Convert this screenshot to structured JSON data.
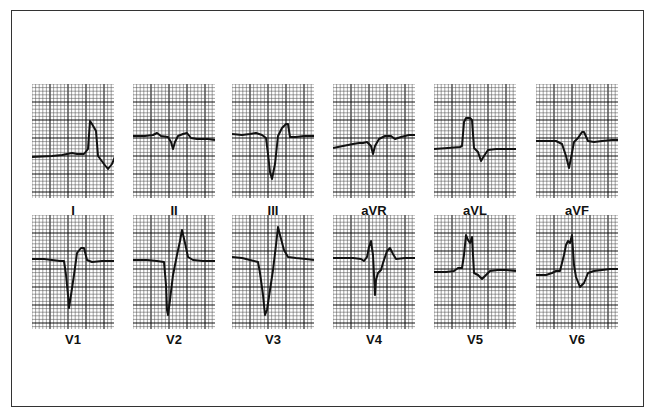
{
  "figure": {
    "title": "",
    "grid": {
      "small_cell_px": 3.6,
      "major_every": 5,
      "minor_color": "#555555",
      "major_color": "#111111",
      "trace_color": "#111111"
    },
    "leads": [
      {
        "label": "I",
        "row": 0,
        "col": 0,
        "points": "0,73 20,72 30,71 40,69 45,70 52,70 56,65 58,37 60,40 64,47 66,72 72,80 76,85 80,80 84,70 96,67 105,67 110,66 115,67"
      },
      {
        "label": "II",
        "row": 0,
        "col": 1,
        "points": "0,52 12,52 20,51 24,49 28,52 35,53 38,58 40,65 42,58 45,52 50,50 54,49 58,54 64,55 75,55 82,56"
      },
      {
        "label": "III",
        "row": 0,
        "col": 2,
        "points": "0,50 10,51 18,50 24,49 30,51 34,54 36,70 38,88 40,95 43,80 46,52 50,44 54,40 56,40 58,53 64,53 72,52 82,52"
      },
      {
        "label": "aVR",
        "row": 0,
        "col": 3,
        "points": "0,64 10,62 20,60 26,59 30,59 34,58 38,62 40,70 42,62 46,55 52,52 58,52 62,55 68,53 76,51 82,51"
      },
      {
        "label": "aVL",
        "row": 0,
        "col": 4,
        "points": "0,65 14,64 26,63 28,62 30,38 32,34 36,34 38,36 40,64 44,68 47,77 50,72 54,66 62,65 72,65 82,65"
      },
      {
        "label": "aVF",
        "row": 0,
        "col": 5,
        "points": "0,57 14,57 20,57 26,60 30,72 33,84 35,74 38,58 42,54 46,48 48,48 52,57 58,58 66,57 76,56 82,56"
      },
      {
        "label": "V1",
        "row": 1,
        "col": 0,
        "points": "0,44 12,44 20,45 28,46 32,46 34,60 36,80 37,93 39,80 42,60 45,38 49,33 52,33 55,45 60,47 70,46 82,46"
      },
      {
        "label": "V2",
        "row": 1,
        "col": 1,
        "points": "0,45 14,45 24,46 31,47 33,70 34,95 35,100 37,85 40,60 44,40 47,26 49,15 52,28 55,42 60,45 70,46 82,46"
      },
      {
        "label": "V3",
        "row": 1,
        "col": 2,
        "points": "0,42 10,43 18,45 26,47 28,58 31,80 33,100 35,95 38,75 41,55 44,30 46,12 48,20 52,35 56,42 64,43 74,44 82,45"
      },
      {
        "label": "V4",
        "row": 1,
        "col": 3,
        "points": "0,43 20,43 28,44 31,46 34,42 36,32 38,26 40,40 41,60 42,80 43,65 45,58 48,55 50,48 54,36 57,33 60,39 63,44 72,43 82,43"
      },
      {
        "label": "V5",
        "row": 1,
        "col": 4,
        "points": "0,57 12,57 20,56 24,53 28,53 30,40 32,20 34,25 36,28 38,22 40,58 44,60 48,64 52,60 56,56 64,55 72,55 82,56"
      },
      {
        "label": "V6",
        "row": 1,
        "col": 5,
        "points": "0,60 10,60 16,58 20,56 24,56 28,40 30,30 32,26 34,28 36,20 38,50 40,62 44,72 48,68 52,58 58,56 66,55 74,54 82,54"
      }
    ],
    "layout": {
      "col_x": [
        32,
        133,
        232,
        333,
        434,
        536
      ],
      "row_y": [
        84,
        215
      ],
      "label_y": [
        203,
        332
      ]
    }
  }
}
